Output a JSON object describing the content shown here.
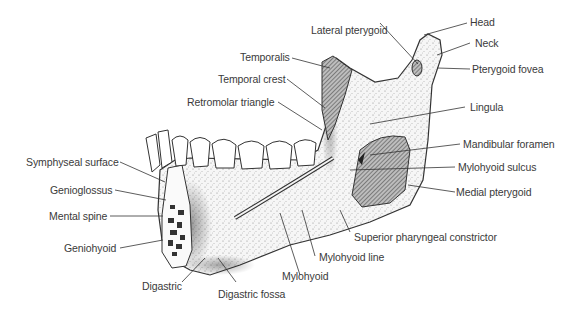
{
  "figure": {
    "labels": {
      "head": "Head",
      "lateral_pterygoid": "Lateral pterygoid",
      "neck": "Neck",
      "pterygoid_fovea": "Pterygoid fovea",
      "temporalis": "Temporalis",
      "temporal_crest": "Temporal crest",
      "retromolar_triangle": "Retromolar triangle",
      "lingula": "Lingula",
      "mandibular_foramen": "Mandibular foramen",
      "mylohyoid_sulcus": "Mylohyoid sulcus",
      "symphyseal_surface": "Symphyseal surface",
      "medial_pterygoid": "Medial pterygoid",
      "genioglossus": "Genioglossus",
      "mental_spine": "Mental spine",
      "geniohyoid": "Geniohyoid",
      "superior_pharyngeal_constrictor": "Superior pharyngeal constrictor",
      "mylohyoid_line": "Mylohyoid line",
      "mylohyoid": "Mylohyoid",
      "digastric": "Digastric",
      "digastric_fossa": "Digastric fossa"
    },
    "colors": {
      "line": "#3a3a3a",
      "bone_fill": "#f4f4f4",
      "muscle_hatch": "#555555",
      "text": "#3a3a3a"
    }
  }
}
